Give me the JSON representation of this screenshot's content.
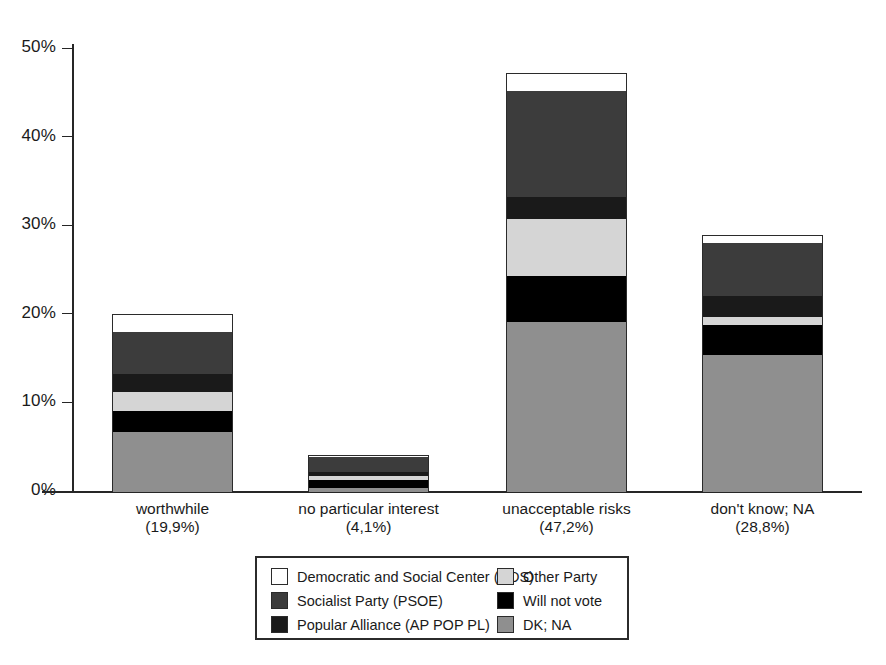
{
  "chart_data": {
    "type": "bar",
    "subtype": "stacked-vertical",
    "title": "",
    "xlabel": "",
    "ylabel": "",
    "ylim": [
      0,
      50
    ],
    "grid": false,
    "legend_position": "bottom",
    "y_ticks": [
      "0%",
      "10%",
      "20%",
      "30%",
      "40%",
      "50%"
    ],
    "y_tick_values": [
      0,
      10,
      20,
      30,
      40,
      50
    ],
    "categories": [
      "worthwhile",
      "no particular interest",
      "unacceptable risks",
      "don't know; NA"
    ],
    "category_percents": [
      "(19,9%)",
      "(4,1%)",
      "(47,2%)",
      "(28,8%)"
    ],
    "series": [
      {
        "name": "DK; NA",
        "color": "#8f8f8f",
        "values": [
          6.8,
          0.5,
          19.2,
          15.5
        ]
      },
      {
        "name": "Will not vote",
        "color": "#000000",
        "values": [
          2.3,
          0.9,
          5.2,
          3.4
        ]
      },
      {
        "name": "Other Party",
        "color": "#d5d5d5",
        "values": [
          2.2,
          0.4,
          6.4,
          0.9
        ]
      },
      {
        "name": "Popular Alliance (AP POP PL)",
        "color": "#1a1a1a",
        "values": [
          2.0,
          0.5,
          2.5,
          2.3
        ]
      },
      {
        "name": "Socialist Party (PSOE)",
        "color": "#3c3c3c",
        "values": [
          4.8,
          1.6,
          12.0,
          6.0
        ]
      },
      {
        "name": "Democratic and Social Center (CDS)",
        "color": "#ffffff",
        "values": [
          1.9,
          0.2,
          1.9,
          0.8
        ]
      }
    ],
    "totals": [
      20.0,
      4.1,
      47.2,
      28.9
    ]
  },
  "legend": {
    "columns": [
      {
        "items": [
          {
            "label": "Democratic and Social Center (CDS)",
            "color": "#ffffff"
          },
          {
            "label": "Socialist Party (PSOE)",
            "color": "#3c3c3c"
          },
          {
            "label": "Popular Alliance (AP POP PL)",
            "color": "#1a1a1a"
          }
        ]
      },
      {
        "items": [
          {
            "label": "Other Party",
            "color": "#d5d5d5"
          },
          {
            "label": "Will not vote",
            "color": "#000000"
          },
          {
            "label": "DK; NA",
            "color": "#8f8f8f"
          }
        ]
      }
    ]
  },
  "axis": {
    "y_labels": [
      "50%",
      "40%",
      "30%",
      "20%",
      "10%",
      "0%"
    ]
  }
}
